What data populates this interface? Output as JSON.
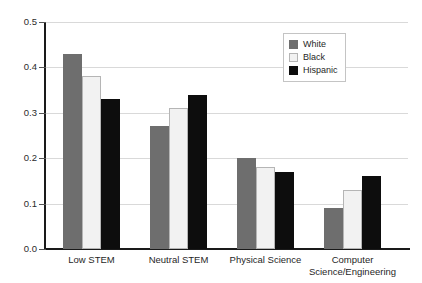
{
  "chart_data": {
    "type": "bar",
    "title": "",
    "subtitle": "",
    "xlabel": "",
    "ylabel": "",
    "ylim": [
      0.0,
      0.5
    ],
    "yticks": [
      "0.0",
      "0.1",
      "0.2",
      "0.3",
      "0.4",
      "0.5"
    ],
    "ytick_values": [
      0.0,
      0.1,
      0.2,
      0.3,
      0.4,
      0.5
    ],
    "grid": true,
    "legend_position": "top-right",
    "categories": [
      "Low STEM",
      "Neutral STEM",
      "Physical Science",
      "Computer Science/Engineering"
    ],
    "category_lines": [
      [
        "Low STEM"
      ],
      [
        "Neutral STEM"
      ],
      [
        "Physical Science"
      ],
      [
        "Computer",
        "Science/Engineering"
      ]
    ],
    "series": [
      {
        "name": "White",
        "color": "#6e6e6e",
        "values": [
          0.43,
          0.27,
          0.2,
          0.09
        ]
      },
      {
        "name": "Black",
        "color": "#f2f2f2",
        "values": [
          0.38,
          0.31,
          0.18,
          0.13
        ]
      },
      {
        "name": "Hispanic",
        "color": "#0d0d0d",
        "values": [
          0.33,
          0.34,
          0.17,
          0.16
        ]
      }
    ]
  },
  "legend": {
    "items": [
      {
        "label": "White"
      },
      {
        "label": "Black"
      },
      {
        "label": "Hispanic"
      }
    ]
  },
  "colors": {
    "background": "#ffffff",
    "axis": "#1a1a1a",
    "gridline": "#d9d9d9",
    "text": "#1f1f1f",
    "series_white": "#6e6e6e",
    "series_black": "#f2f2f2",
    "series_hispanic": "#0d0d0d"
  }
}
